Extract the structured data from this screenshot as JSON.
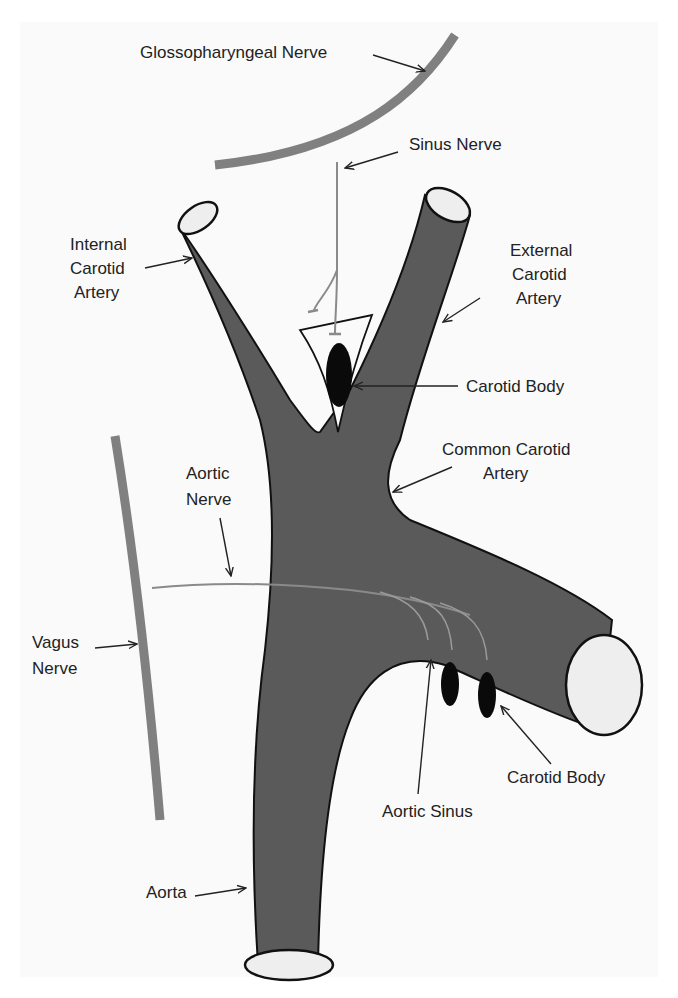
{
  "diagram": {
    "colors": {
      "vessel": "#5a5a5a",
      "vessel_outline": "#111111",
      "vessel_opening": "#eeeeee",
      "nerve": "#808080",
      "body": "#0a0a0a",
      "background": "#fafafa"
    },
    "labels": {
      "glossopharyngeal": "Glossopharyngeal Nerve",
      "sinus_nerve": "Sinus Nerve",
      "internal_carotid_1": "Internal",
      "internal_carotid_2": "Carotid",
      "internal_carotid_3": "Artery",
      "external_carotid_1": "External",
      "external_carotid_2": "Carotid",
      "external_carotid_3": "Artery",
      "carotid_body_upper": "Carotid Body",
      "common_carotid_1": "Common Carotid",
      "common_carotid_2": "Artery",
      "aortic_nerve_1": "Aortic",
      "aortic_nerve_2": "Nerve",
      "vagus_1": "Vagus",
      "vagus_2": "Nerve",
      "carotid_body_lower": "Carotid Body",
      "aortic_sinus": "Aortic Sinus",
      "aorta": "Aorta"
    }
  }
}
